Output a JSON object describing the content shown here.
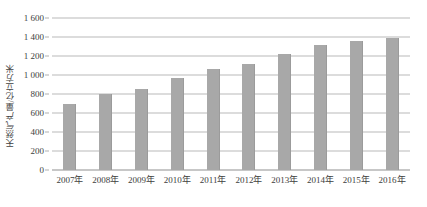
{
  "chart_data": {
    "type": "bar",
    "title": "",
    "subtitle": "",
    "xlabel": "",
    "ylabel": "天然气产量/亿立方米",
    "categories": [
      "2007年",
      "2008年",
      "2009年",
      "2010年",
      "2011年",
      "2012年",
      "2013年",
      "2014年",
      "2015年",
      "2016年"
    ],
    "values": [
      690,
      800,
      853,
      965,
      1063,
      1120,
      1220,
      1318,
      1363,
      1385
    ],
    "series": [
      {
        "name": "天然气产量",
        "values": [
          690,
          800,
          853,
          965,
          1063,
          1120,
          1220,
          1318,
          1363,
          1385
        ]
      }
    ],
    "ylim": [
      0,
      1600
    ],
    "y_tick_labels": [
      "0",
      "200",
      "400",
      "600",
      "800",
      "1 000",
      "1 200",
      "1 400",
      "1 600"
    ],
    "y_tick_values": [
      0,
      200,
      400,
      600,
      800,
      1000,
      1200,
      1400,
      1600
    ],
    "grid": true,
    "legend": false,
    "legend_position": "none",
    "bar_color": "#a8a8a8",
    "grid_color": "#b9b9b9",
    "axis_color": "#8f8f8f",
    "text_color": "#3d3d3d",
    "background": "#ffffff"
  }
}
